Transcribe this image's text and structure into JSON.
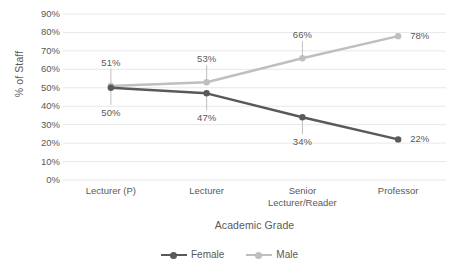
{
  "chart_data": {
    "type": "line",
    "title": "",
    "categories": [
      "Lecturer (P)",
      "Lecturer",
      "Senior Lecturer/Reader",
      "Professor"
    ],
    "series": [
      {
        "name": "Female",
        "color": "#595959",
        "values": [
          50,
          47,
          34,
          22
        ],
        "labels": [
          "50%",
          "47%",
          "34%",
          "22%"
        ]
      },
      {
        "name": "Male",
        "color": "#BFBFBF",
        "values": [
          51,
          53,
          66,
          78
        ],
        "labels": [
          "51%",
          "53%",
          "66%",
          "78%"
        ]
      }
    ],
    "xlabel": "Academic Grade",
    "ylabel": "% of Staff",
    "ylim": [
      0,
      90
    ],
    "ytick_labels": [
      "90%",
      "80%",
      "70%",
      "60%",
      "50%",
      "40%",
      "30%",
      "20%",
      "10%",
      "0%"
    ],
    "ytick_values": [
      90,
      80,
      70,
      60,
      50,
      40,
      30,
      20,
      10,
      0
    ],
    "grid": true,
    "grid_color": "#E8E8E8",
    "legend_position": "bottom",
    "background": "#FFFFFF"
  },
  "axes": {
    "y_title": "% of Staff",
    "x_title": "Academic Grade"
  },
  "legend": {
    "items": [
      {
        "label": "Female",
        "color": "#595959"
      },
      {
        "label": "Male",
        "color": "#BFBFBF"
      }
    ]
  }
}
